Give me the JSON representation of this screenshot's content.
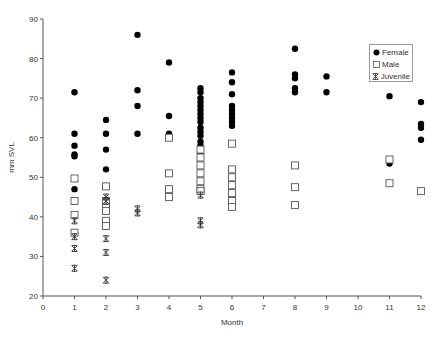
{
  "chart_data": {
    "type": "scatter",
    "title": "",
    "xlabel": "Month",
    "ylabel": "mm SVL",
    "xlim": [
      0,
      12
    ],
    "ylim": [
      20,
      90
    ],
    "xticks": [
      0,
      1,
      2,
      3,
      4,
      5,
      6,
      7,
      8,
      9,
      10,
      11,
      12
    ],
    "yticks": [
      20,
      30,
      40,
      50,
      60,
      70,
      80,
      90
    ],
    "grid": false,
    "legend_position": "upper right",
    "series": [
      {
        "name": "Female",
        "marker": "filled-circle",
        "points": [
          [
            1,
            71.5
          ],
          [
            1,
            61
          ],
          [
            1,
            58
          ],
          [
            1,
            55.8
          ],
          [
            1,
            55.3
          ],
          [
            1,
            47
          ],
          [
            2,
            64.5
          ],
          [
            2,
            61
          ],
          [
            2,
            57
          ],
          [
            2,
            52
          ],
          [
            3,
            86
          ],
          [
            3,
            72
          ],
          [
            3,
            68
          ],
          [
            3,
            61
          ],
          [
            4,
            79
          ],
          [
            4,
            65.5
          ],
          [
            4,
            61
          ],
          [
            5,
            72.5
          ],
          [
            5,
            71.5
          ],
          [
            5,
            70
          ],
          [
            5,
            69
          ],
          [
            5,
            68
          ],
          [
            5,
            67
          ],
          [
            5,
            66
          ],
          [
            5,
            65
          ],
          [
            5,
            64
          ],
          [
            5,
            62.5
          ],
          [
            5,
            61.5
          ],
          [
            5,
            60.5
          ],
          [
            5,
            59
          ],
          [
            5,
            58
          ],
          [
            5,
            56
          ],
          [
            6,
            76.5
          ],
          [
            6,
            74
          ],
          [
            6,
            71
          ],
          [
            6,
            68
          ],
          [
            6,
            67
          ],
          [
            6,
            66
          ],
          [
            6,
            65
          ],
          [
            6,
            64
          ],
          [
            6,
            63
          ],
          [
            8,
            82.5
          ],
          [
            8,
            76
          ],
          [
            8,
            75
          ],
          [
            8,
            72.5
          ],
          [
            8,
            71.5
          ],
          [
            9,
            75.5
          ],
          [
            9,
            71.5
          ],
          [
            11,
            70.5
          ],
          [
            11,
            53.5
          ],
          [
            12,
            69
          ],
          [
            12,
            63.5
          ],
          [
            12,
            62.5
          ],
          [
            12,
            59.5
          ]
        ]
      },
      {
        "name": "Male",
        "marker": "open-square",
        "points": [
          [
            1,
            49.7
          ],
          [
            1,
            44
          ],
          [
            1,
            40.5
          ],
          [
            1,
            36
          ],
          [
            2,
            47.7
          ],
          [
            2,
            44
          ],
          [
            2,
            42.3
          ],
          [
            2,
            41.5
          ],
          [
            2,
            39
          ],
          [
            2,
            37.7
          ],
          [
            4,
            60
          ],
          [
            4,
            51
          ],
          [
            4,
            47
          ],
          [
            4,
            45
          ],
          [
            5,
            57
          ],
          [
            5,
            55
          ],
          [
            5,
            53
          ],
          [
            5,
            51
          ],
          [
            5,
            49
          ],
          [
            5,
            47
          ],
          [
            5,
            46.5
          ],
          [
            6,
            58.5
          ],
          [
            6,
            52
          ],
          [
            6,
            50
          ],
          [
            6,
            48
          ],
          [
            6,
            46
          ],
          [
            6,
            44
          ],
          [
            6,
            42.5
          ],
          [
            8,
            53
          ],
          [
            8,
            47.5
          ],
          [
            8,
            43
          ],
          [
            11,
            54.5
          ],
          [
            11,
            48.5
          ],
          [
            12,
            46.5
          ]
        ]
      },
      {
        "name": "Juvenile",
        "marker": "asterisk",
        "points": [
          [
            1,
            39
          ],
          [
            1,
            35
          ],
          [
            1,
            32
          ],
          [
            1,
            27
          ],
          [
            2,
            45
          ],
          [
            2,
            44
          ],
          [
            2,
            34.5
          ],
          [
            2,
            31
          ],
          [
            2,
            24
          ],
          [
            3,
            42
          ],
          [
            3,
            41
          ],
          [
            5,
            45.5
          ],
          [
            5,
            39
          ],
          [
            5,
            38
          ]
        ]
      }
    ]
  },
  "legend": {
    "items": [
      {
        "label": "Female"
      },
      {
        "label": "Male"
      },
      {
        "label": "Juvenile"
      }
    ]
  },
  "colors": {
    "marker": "#000000",
    "axis": "#555555",
    "text": "#333333"
  }
}
